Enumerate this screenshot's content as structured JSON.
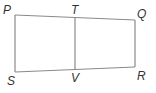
{
  "diagram": {
    "stroke_color": "#8a8a8a",
    "label_color": "#333333",
    "points": {
      "P": {
        "label": "P",
        "x": 15,
        "y": 15
      },
      "T": {
        "label": "T",
        "x": 75,
        "y": 17
      },
      "Q": {
        "label": "Q",
        "x": 135,
        "y": 20
      },
      "R": {
        "label": "R",
        "x": 135,
        "y": 67
      },
      "V": {
        "label": "V",
        "x": 75,
        "y": 69
      },
      "S": {
        "label": "S",
        "x": 15,
        "y": 72
      }
    },
    "segments": [
      "PQ",
      "QR",
      "RS",
      "SP",
      "TV"
    ]
  }
}
